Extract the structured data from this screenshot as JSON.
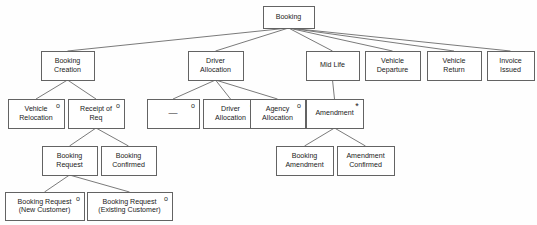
{
  "diagram": {
    "type": "jackson-structure-diagram",
    "canvas": {
      "width": 537,
      "height": 225
    },
    "style": {
      "background": "#fefefe",
      "box_fill": "#ffffff",
      "box_stroke": "#636363",
      "line_stroke": "#6b6b6b",
      "text_color": "#1b1b1b"
    },
    "marker_legend": {
      "o": "optional (selection) marker",
      "*": "iteration marker"
    },
    "nodes": [
      {
        "id": "booking",
        "lines": [
          "Booking"
        ],
        "marker": "",
        "x": 263,
        "y": 6,
        "w": 51,
        "h": 22,
        "level": 0
      },
      {
        "id": "booking-creation",
        "lines": [
          "Booking",
          "Creation"
        ],
        "marker": "",
        "x": 41,
        "y": 51,
        "w": 53,
        "h": 29,
        "level": 1
      },
      {
        "id": "driver-allocation-group",
        "lines": [
          "Driver",
          "Allocation"
        ],
        "marker": "",
        "x": 188,
        "y": 51,
        "w": 55,
        "h": 29,
        "level": 1
      },
      {
        "id": "mid-life",
        "lines": [
          "Mid Life"
        ],
        "marker": "",
        "x": 306,
        "y": 51,
        "w": 53,
        "h": 29,
        "level": 1
      },
      {
        "id": "vehicle-departure",
        "lines": [
          "Vehicle",
          "Departure"
        ],
        "marker": "",
        "x": 365,
        "y": 51,
        "w": 55,
        "h": 29,
        "level": 1
      },
      {
        "id": "vehicle-return",
        "lines": [
          "Vehicle",
          "Return"
        ],
        "marker": "",
        "x": 427,
        "y": 51,
        "w": 54,
        "h": 29,
        "level": 1
      },
      {
        "id": "invoice-issued",
        "lines": [
          "Invoice",
          "Issued"
        ],
        "marker": "",
        "x": 487,
        "y": 51,
        "w": 47,
        "h": 29,
        "level": 1
      },
      {
        "id": "vehicle-relocation",
        "lines": [
          "Vehicle",
          "Relocation"
        ],
        "marker": "o",
        "x": 8,
        "y": 99,
        "w": 56,
        "h": 29,
        "level": 2
      },
      {
        "id": "receipt-of-req",
        "lines": [
          "Receipt of",
          "Req"
        ],
        "marker": "o",
        "x": 68,
        "y": 99,
        "w": 56,
        "h": 29,
        "level": 2
      },
      {
        "id": "dash-node",
        "lines": [
          "—"
        ],
        "marker": "o",
        "x": 147,
        "y": 99,
        "w": 52,
        "h": 29,
        "level": 2
      },
      {
        "id": "driver-allocation",
        "lines": [
          "Driver",
          "Allocation"
        ],
        "marker": "o",
        "x": 203,
        "y": 99,
        "w": 55,
        "h": 29,
        "level": 2
      },
      {
        "id": "agency-allocation",
        "lines": [
          "Agency",
          "Allocation"
        ],
        "marker": "o",
        "x": 250,
        "y": 99,
        "w": 55,
        "h": 29,
        "level": 2
      },
      {
        "id": "amendment",
        "lines": [
          "Amendment"
        ],
        "marker": "*",
        "x": 306,
        "y": 99,
        "w": 57,
        "h": 29,
        "level": 2
      },
      {
        "id": "booking-request",
        "lines": [
          "Booking",
          "Request"
        ],
        "marker": "",
        "x": 42,
        "y": 146,
        "w": 55,
        "h": 29,
        "level": 3
      },
      {
        "id": "booking-confirmed",
        "lines": [
          "Booking",
          "Confirmed"
        ],
        "marker": "",
        "x": 101,
        "y": 146,
        "w": 55,
        "h": 29,
        "level": 3
      },
      {
        "id": "booking-amendment",
        "lines": [
          "Booking",
          "Amendment"
        ],
        "marker": "",
        "x": 276,
        "y": 146,
        "w": 57,
        "h": 29,
        "level": 3
      },
      {
        "id": "amendment-confirmed",
        "lines": [
          "Amendment",
          "Confirmed"
        ],
        "marker": "",
        "x": 337,
        "y": 146,
        "w": 57,
        "h": 29,
        "level": 3
      },
      {
        "id": "booking-request-new",
        "lines": [
          "Booking Request",
          "(New Customer)"
        ],
        "marker": "o",
        "x": 5,
        "y": 192,
        "w": 79,
        "h": 28,
        "level": 4
      },
      {
        "id": "booking-request-existing",
        "lines": [
          "Booking Request",
          "(Existing Customer)"
        ],
        "marker": "o",
        "x": 87,
        "y": 192,
        "w": 85,
        "h": 28,
        "level": 4
      }
    ],
    "edges": [
      {
        "from": "booking",
        "to": "booking-creation"
      },
      {
        "from": "booking",
        "to": "driver-allocation-group"
      },
      {
        "from": "booking",
        "to": "mid-life"
      },
      {
        "from": "booking",
        "to": "vehicle-departure"
      },
      {
        "from": "booking",
        "to": "vehicle-return"
      },
      {
        "from": "booking",
        "to": "invoice-issued"
      },
      {
        "from": "booking-creation",
        "to": "vehicle-relocation"
      },
      {
        "from": "booking-creation",
        "to": "receipt-of-req"
      },
      {
        "from": "driver-allocation-group",
        "to": "dash-node"
      },
      {
        "from": "driver-allocation-group",
        "to": "driver-allocation"
      },
      {
        "from": "driver-allocation-group",
        "to": "agency-allocation"
      },
      {
        "from": "mid-life",
        "to": "amendment"
      },
      {
        "from": "receipt-of-req",
        "to": "booking-request"
      },
      {
        "from": "receipt-of-req",
        "to": "booking-confirmed"
      },
      {
        "from": "amendment",
        "to": "booking-amendment"
      },
      {
        "from": "amendment",
        "to": "amendment-confirmed"
      },
      {
        "from": "booking-request",
        "to": "booking-request-new"
      },
      {
        "from": "booking-request",
        "to": "booking-request-existing"
      }
    ]
  }
}
